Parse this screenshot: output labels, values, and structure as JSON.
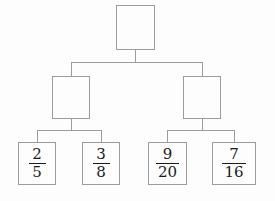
{
  "diagram": {
    "type": "tree",
    "line_color": "#9c9c9c",
    "text_color": "#1a1a1a",
    "background": "#fdfdfd",
    "root": {
      "label": "",
      "filled": false
    },
    "branches": [
      {
        "label": "",
        "filled": false
      },
      {
        "label": "",
        "filled": false
      }
    ],
    "leaves": [
      {
        "numerator": "2",
        "denominator": "5"
      },
      {
        "numerator": "3",
        "denominator": "8"
      },
      {
        "numerator": "9",
        "denominator": "20"
      },
      {
        "numerator": "7",
        "denominator": "16"
      }
    ]
  }
}
